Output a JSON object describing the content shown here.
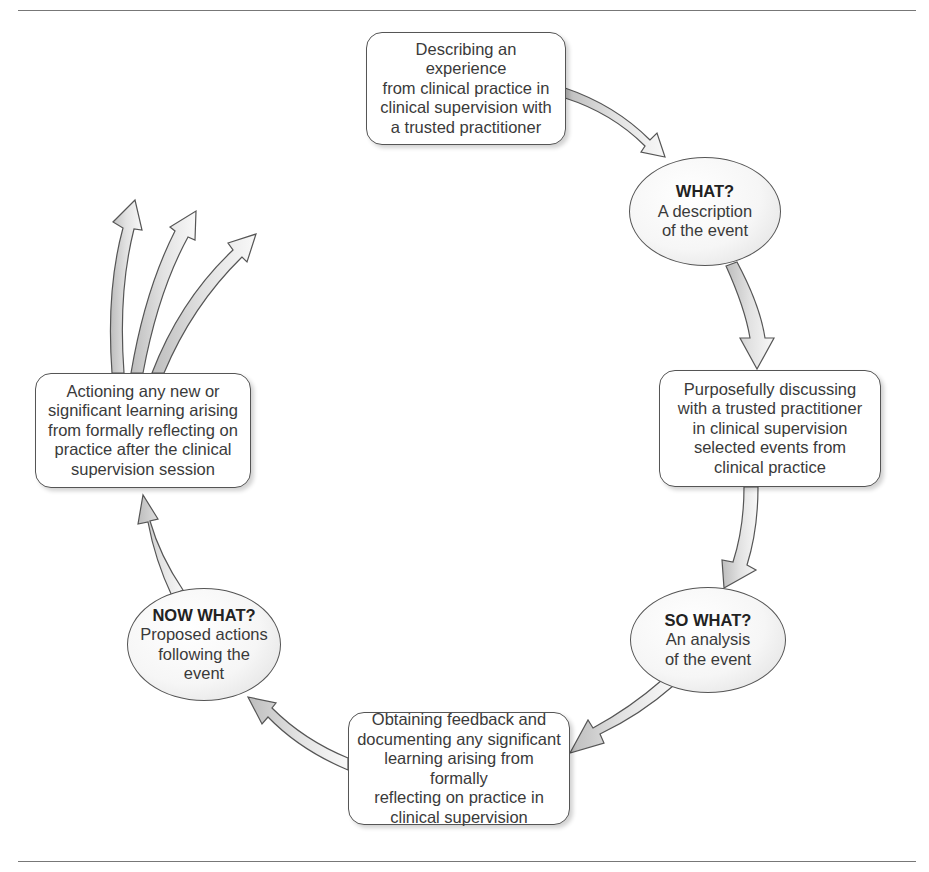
{
  "diagram": {
    "type": "cyclical reflective-practice model",
    "colors": {
      "stroke": "#555555",
      "arrow_fill": "#d0d0d0",
      "rule": "#777777"
    },
    "nodes": {
      "describe": {
        "lines": [
          "Describing an experience",
          "from clinical practice in",
          "clinical supervision with",
          "a trusted practitioner"
        ]
      },
      "what": {
        "heading": "WHAT?",
        "lines": [
          "A description",
          "of the event"
        ]
      },
      "discuss": {
        "lines": [
          "Purposefully discussing",
          "with a trusted practitioner",
          "in clinical supervision",
          "selected events from",
          "clinical practice"
        ]
      },
      "so_what": {
        "heading": "SO WHAT?",
        "lines": [
          "An analysis",
          "of the event"
        ]
      },
      "feedback": {
        "lines": [
          "Obtaining feedback and",
          "documenting any significant",
          "learning arising from formally",
          "reflecting on practice in",
          "clinical supervision"
        ]
      },
      "now_what": {
        "heading": "NOW WHAT?",
        "lines": [
          "Proposed actions",
          "following the",
          "event"
        ]
      },
      "actioning": {
        "lines": [
          "Actioning any new or",
          "significant learning arising",
          "from formally reflecting on",
          "practice after the clinical",
          "supervision session"
        ]
      }
    },
    "flow": [
      "describe",
      "what",
      "discuss",
      "so_what",
      "feedback",
      "now_what",
      "actioning",
      "outward (3 arrows)"
    ]
  }
}
